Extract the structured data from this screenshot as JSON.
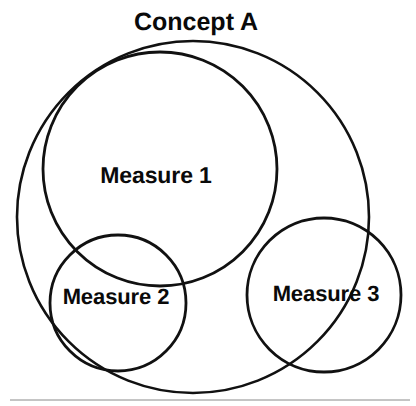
{
  "figure": {
    "title": "Concept A",
    "title_position": {
      "x": 196,
      "y": 22
    },
    "background_color": "#ffffff",
    "stroke_color": "#111111",
    "text_color": "#0a0a0a",
    "baseline_rule_color": "#8a8a8a",
    "type": "venn-diagram",
    "circles": [
      {
        "name": "concept-a",
        "label": "Concept A",
        "label_shown": true,
        "cx": 193,
        "cy": 217,
        "r": 176,
        "stroke_width": 2.6
      },
      {
        "name": "measure-1",
        "label": "Measure 1",
        "label_shown": true,
        "cx": 160,
        "cy": 169,
        "r": 117,
        "stroke_width": 2.8
      },
      {
        "name": "measure-2",
        "label": "Measure 2",
        "label_shown": true,
        "cx": 118,
        "cy": 303,
        "r": 68,
        "stroke_width": 2.8
      },
      {
        "name": "measure-3",
        "label": "Measure 3",
        "label_shown": true,
        "cx": 324,
        "cy": 295,
        "r": 77,
        "stroke_width": 2.8
      }
    ],
    "labels": {
      "measure_1": {
        "text": "Measure 1",
        "x": 156,
        "y": 175
      },
      "measure_2": {
        "text": "Measure 2",
        "x": 116,
        "y": 297
      },
      "measure_3": {
        "text": "Measure 3",
        "x": 326,
        "y": 294
      }
    },
    "baseline_rule": {
      "name": "baseline-rule",
      "x1": 10,
      "x2": 410,
      "y": 400,
      "width": 1
    }
  }
}
